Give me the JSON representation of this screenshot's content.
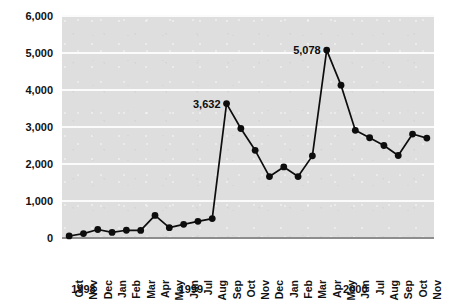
{
  "chart_data": {
    "type": "line",
    "title": "",
    "xlabel": "",
    "ylabel": "",
    "ylim": [
      0,
      6000
    ],
    "ytick_values": [
      0,
      1000,
      2000,
      3000,
      4000,
      5000,
      6000
    ],
    "ytick_labels": [
      "0",
      "1,000",
      "2,000",
      "3,000",
      "4,000",
      "5,000",
      "6,000"
    ],
    "grid": true,
    "legend": "none",
    "categories": [
      "Oct",
      "Nov",
      "Dec",
      "Jan",
      "Feb",
      "Mar",
      "Apr",
      "May",
      "Jun",
      "Jul",
      "Aug",
      "Sep",
      "Oct",
      "Nov",
      "Dec",
      "Jan",
      "Feb",
      "Mar",
      "Apr",
      "May",
      "Jun",
      "Jul",
      "Aug",
      "Sep",
      "Oct",
      "Nov"
    ],
    "values": [
      55,
      120,
      230,
      150,
      210,
      205,
      610,
      280,
      370,
      450,
      525,
      3632,
      2960,
      2370,
      1660,
      1920,
      1660,
      2220,
      5078,
      4130,
      2910,
      2710,
      2500,
      2230,
      2810,
      2700
    ],
    "point_labels": [
      {
        "index": 11,
        "text": "3,632"
      },
      {
        "index": 18,
        "text": "5,078"
      }
    ],
    "year_groups": [
      {
        "label": "1998",
        "start_index": 0,
        "end_index": 2
      },
      {
        "label": "1999",
        "start_index": 3,
        "end_index": 14
      },
      {
        "label": "2000",
        "start_index": 15,
        "end_index": 25
      }
    ],
    "colors": {
      "plot_background": "#dededf",
      "gridline": "#fbfbfb",
      "series": "#0d0d0d",
      "axis_text": "#121212",
      "baseline": "#8d8d8d"
    }
  }
}
